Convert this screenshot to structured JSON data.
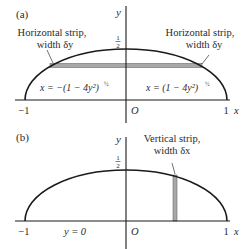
{
  "panels": [
    {
      "id": "a",
      "tag": "(a)",
      "axes": {
        "y_label": "y",
        "x_label": "x",
        "origin_label": "O",
        "x_min_label": "−1",
        "x_max_label": "1",
        "y_top_label_num": "1",
        "y_top_label_den": "2"
      },
      "annotations": {
        "left_strip_line1": "Horizontal strip,",
        "left_strip_line2": "width δy",
        "right_strip_line1": "Horizontal strip,",
        "right_strip_line2": "width δy",
        "left_curve_eq": "x = −(1 − 4y²)",
        "left_curve_exp": "½",
        "right_curve_eq": "x = (1 − 4y²)",
        "right_curve_exp": "½"
      },
      "strip": {
        "orientation": "horizontal",
        "color": "#a8a8a8"
      }
    },
    {
      "id": "b",
      "tag": "(b)",
      "axes": {
        "y_label": "y",
        "x_label": "x",
        "origin_label": "O",
        "x_min_label": "−1",
        "x_max_label": "1",
        "y_top_label_num": "1",
        "y_top_label_den": "2"
      },
      "annotations": {
        "strip_line1": "Vertical strip,",
        "strip_line2": "width δx",
        "base_eq": "y = 0"
      },
      "strip": {
        "orientation": "vertical",
        "color": "#a8a8a8"
      }
    }
  ],
  "colors": {
    "ink": "#1a1a1a",
    "strip_fill": "#a8a8a8"
  }
}
